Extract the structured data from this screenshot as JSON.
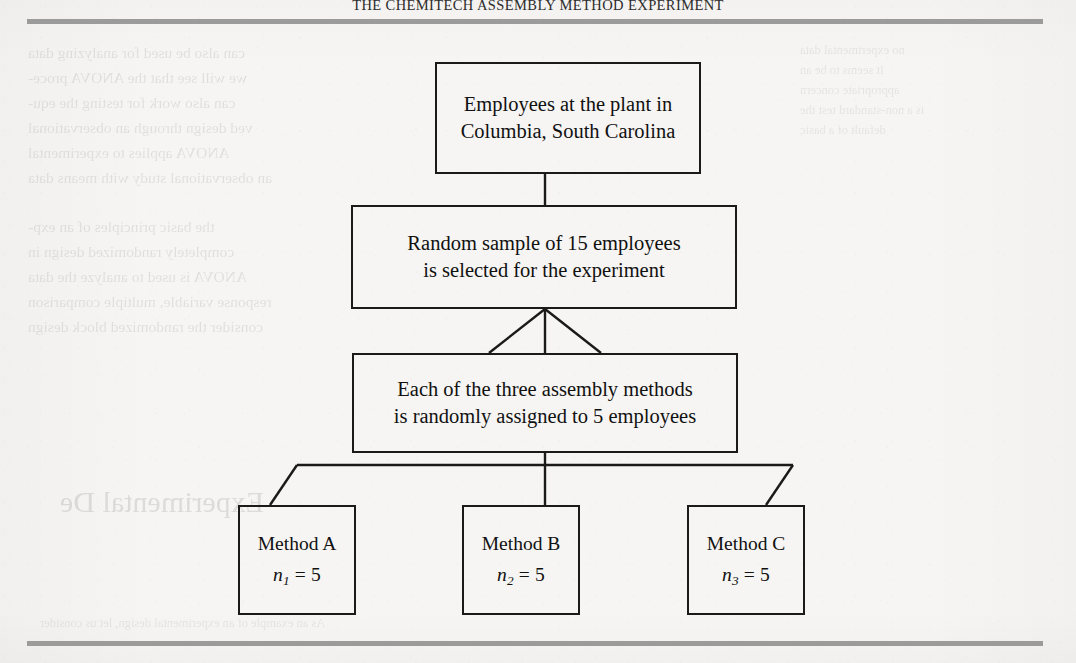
{
  "page": {
    "running_head": "THE CHEMITECH ASSEMBLY METHOD EXPERIMENT",
    "rule_color": "#9b9b9b",
    "ink_color": "#1a1a1a",
    "paper_color": "#f6f5f3"
  },
  "diagram": {
    "type": "flowchart",
    "nodes": [
      {
        "id": "population",
        "line1": "Employees at the plant in",
        "line2": "Columbia, South Carolina"
      },
      {
        "id": "sample",
        "line1": "Random sample of 15 employees",
        "line2": "is selected for the experiment"
      },
      {
        "id": "assignment",
        "line1": "Each of the three assembly methods",
        "line2": "is randomly assigned to 5 employees"
      }
    ],
    "methods": [
      {
        "id": "method-a",
        "name": "Method A",
        "n_symbol": "n",
        "n_subscript": "1",
        "n_equals": "= 5"
      },
      {
        "id": "method-b",
        "name": "Method B",
        "n_symbol": "n",
        "n_subscript": "2",
        "n_equals": "= 5"
      },
      {
        "id": "method-c",
        "name": "Method C",
        "n_symbol": "n",
        "n_subscript": "3",
        "n_equals": "= 5"
      }
    ]
  },
  "showthrough": {
    "note": "Faint mirrored bleed-through text from the reverse page; largely illegible.",
    "left_block": [
      "can also be used for analyzing data",
      "we will see that the ANOVA proce-",
      "can also work for testing the equ-",
      "ved design through an observational",
      "ANOVA applies to experimental",
      "an observational study with means data",
      "the basic principles of an exp-",
      "completely randomized design in",
      "ANOVA is used to analyze the data",
      "response variable, multiple comparison",
      "consider the randomized block design"
    ],
    "right_block": [
      "no experimental data",
      "It seems to be an",
      "appropriate concern",
      "is a non-standard test the",
      "default of a basic"
    ],
    "big_mirrored": "Experimental De",
    "bottom_line": "As an example of an experimental design, let us consider"
  }
}
